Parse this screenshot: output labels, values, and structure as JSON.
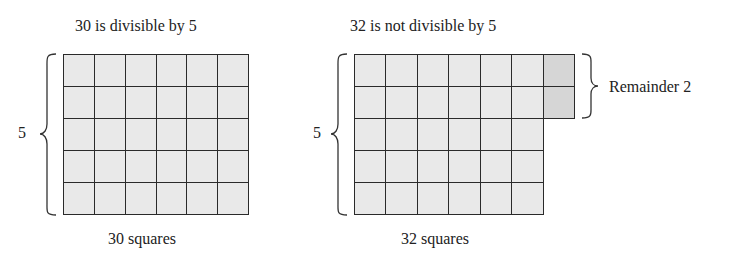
{
  "left_figure": {
    "title": "30 is divisible by 5",
    "rows_label": "5",
    "caption": "30 squares",
    "rows": 5,
    "cols": 6,
    "total": 30
  },
  "right_figure": {
    "title": "32 is not divisible by 5",
    "rows_label": "5",
    "caption": "32 squares",
    "rows": 5,
    "full_cols": 6,
    "remainder_cells": 2,
    "remainder_label": "Remainder 2",
    "total": 32
  },
  "colors": {
    "cell_fill": "#e9e9e9",
    "remainder_fill": "#d6d6d6",
    "grid_line": "#2a2a2a"
  }
}
